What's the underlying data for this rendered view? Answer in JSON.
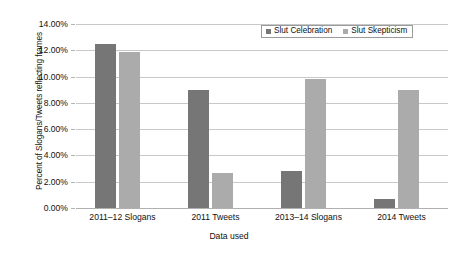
{
  "chart_data": {
    "type": "bar",
    "title": "",
    "xlabel": "Data used",
    "ylabel": "Percent of Slogans/Tweets reflecting frames",
    "categories": [
      "2011–12 Slogans",
      "2011 Tweets",
      "2013–14 Slogans",
      "2014 Tweets"
    ],
    "series": [
      {
        "name": "Slut Celebration",
        "color": "#767676",
        "values": [
          12.5,
          9.0,
          2.85,
          0.65
        ]
      },
      {
        "name": "Slut Skepticism",
        "color": "#ababab",
        "values": [
          11.9,
          2.7,
          9.85,
          9.0
        ]
      }
    ],
    "ylim": [
      0,
      14
    ],
    "ytick_step": 2,
    "ytick_labels": [
      "0.00%",
      "2.00%",
      "4.00%",
      "6.00%",
      "8.00%",
      "10.00%",
      "12.00%",
      "14.00%"
    ],
    "ytick_values": [
      0,
      2,
      4,
      6,
      8,
      10,
      12,
      14
    ],
    "grid": true,
    "legend_position": "top-right",
    "value_format": "percent"
  }
}
